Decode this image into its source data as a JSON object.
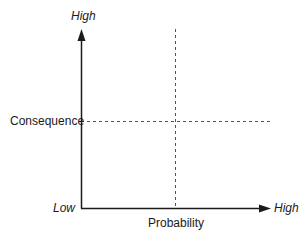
{
  "diagram": {
    "type": "2x2 risk matrix",
    "y_axis": {
      "label": "Consequence",
      "high_label": "High",
      "low_label": "Low"
    },
    "x_axis": {
      "label": "Probability",
      "high_label": "High",
      "low_label": "Low"
    },
    "colors": {
      "axis": "#1a1a1a",
      "divider": "#555555",
      "background": "#ffffff"
    }
  }
}
